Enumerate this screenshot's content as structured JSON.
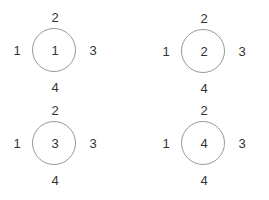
{
  "diagram": {
    "nodes": [
      {
        "center": "1",
        "top": "2",
        "left": "1",
        "right": "3",
        "bottom": "4"
      },
      {
        "center": "2",
        "top": "2",
        "left": "1",
        "right": "3",
        "bottom": "4"
      },
      {
        "center": "3",
        "top": "2",
        "left": "1",
        "right": "3",
        "bottom": "4"
      },
      {
        "center": "4",
        "top": "2",
        "left": "1",
        "right": "3",
        "bottom": "4"
      }
    ],
    "colors": {
      "circle_stroke": "#999999",
      "text": "#333333"
    }
  }
}
